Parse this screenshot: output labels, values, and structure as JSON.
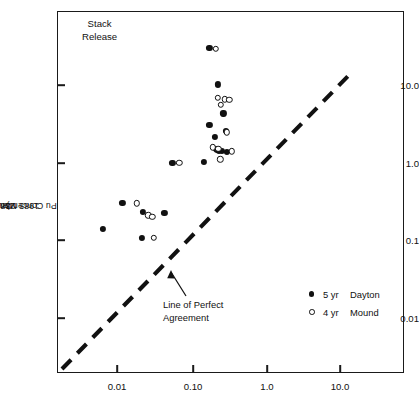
{
  "chart_data": {
    "type": "scatter",
    "title": "",
    "annotation_title": "Stack\nRelease",
    "xlabel": "",
    "ylabel": "1985 Monitored 238Pu Concentration (aCi/m3)",
    "ylabel_parts": {
      "pre": "1985 Monitored ",
      "sup1": "238",
      "mid": "Pu Concentration (aCi/m",
      "sup2": "3",
      "post": ")"
    },
    "xscale": "log",
    "yscale": "log",
    "xlim": [
      0.0025,
      42.0
    ],
    "ylim": [
      0.0032,
      52.0
    ],
    "grid": false,
    "xticks": [
      0.01,
      0.1,
      1.0,
      10.0
    ],
    "xtick_labels": [
      "0.01",
      "0.10",
      "1.0",
      "10.0"
    ],
    "yticks": [
      0.01,
      0.1,
      1.0,
      10.0
    ],
    "ytick_labels": [
      "0.01",
      "0.1",
      "1.0",
      "10.0"
    ],
    "legend_position": "lower-right-inside",
    "reference_line": {
      "label": "Line of Perfect Agreement",
      "label_lines": [
        "Line of Perfect",
        "Agreement"
      ],
      "style": "dashed",
      "slope": 1,
      "intercept": 0,
      "color": "#111111"
    },
    "series": [
      {
        "name": "5 yr  Dayton",
        "legend_year": "5 yr",
        "legend_site": "Dayton",
        "marker": "filled-circle",
        "color": "#111111",
        "points": [
          [
            0.175,
            30.0
          ],
          [
            0.23,
            10.2
          ],
          [
            0.29,
            2.55
          ],
          [
            0.148,
            1.02
          ],
          [
            0.27,
            4.3
          ],
          [
            0.175,
            3.05
          ],
          [
            0.205,
            2.15
          ],
          [
            0.215,
            1.52
          ],
          [
            0.222,
            1.48
          ],
          [
            0.232,
            1.44
          ],
          [
            0.255,
            1.42
          ],
          [
            0.3,
            1.38
          ],
          [
            0.0118,
            0.3
          ],
          [
            0.0225,
            0.232
          ],
          [
            0.0435,
            0.225
          ],
          [
            0.0064,
            0.14
          ],
          [
            0.0215,
            0.108
          ],
          [
            0.0555,
            0.985
          ]
        ]
      },
      {
        "name": "4 yr  Mound",
        "legend_year": "4 yr",
        "legend_site": "Mound",
        "marker": "open-circle",
        "color": "#111111",
        "points": [
          [
            0.215,
            29.5
          ],
          [
            0.225,
            6.9
          ],
          [
            0.282,
            6.55
          ],
          [
            0.325,
            6.45
          ],
          [
            0.247,
            5.55
          ],
          [
            0.3,
            2.45
          ],
          [
            0.35,
            1.4
          ],
          [
            0.196,
            1.58
          ],
          [
            0.23,
            1.5
          ],
          [
            0.245,
            1.1
          ],
          [
            0.069,
            1.0
          ],
          [
            0.0185,
            0.3
          ],
          [
            0.0265,
            0.21
          ],
          [
            0.03,
            0.2
          ],
          [
            0.031,
            0.108
          ]
        ]
      }
    ]
  }
}
